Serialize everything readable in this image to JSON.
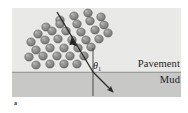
{
  "figure": {
    "type": "physics-refraction-diagram",
    "caption_mark": "a",
    "regions": [
      {
        "id": "pavement",
        "label": "Pavement",
        "color": "#e9e9e7"
      },
      {
        "id": "mud",
        "label": "Mud",
        "color": "#c9c9c7"
      }
    ],
    "labels": {
      "pavement": "Pavement",
      "mud": "Mud",
      "angle_symbol": "θ",
      "angle_subscript": "1"
    },
    "colors": {
      "pavement_fill": "#e9e9e7",
      "mud_fill": "#c8c8c6",
      "interface_line": "#8f8f8d",
      "ray_line": "#242424",
      "normal_line": "#3a3a3a",
      "dot_fill": "#8c8c8c",
      "dot_stroke": "#5c5c5c",
      "dot_highlight": "#f2f2f0",
      "text": "#1d1d1d",
      "background": "#ffffff"
    },
    "geometry": {
      "box_left": 12,
      "box_top": 8,
      "box_right": 181,
      "box_bottom": 97,
      "interface_y": 72,
      "normal_x": 93,
      "incidence_point_x": 93,
      "incidence_point_y": 72
    },
    "incident_ray": {
      "from_x": 57,
      "from_y": 12,
      "to_x": 93,
      "to_y": 72,
      "has_arrowhead": true,
      "arrow_mid_x": 75,
      "arrow_mid_y": 42
    },
    "refracted_ray": {
      "from_x": 93,
      "from_y": 72,
      "to_x": 117,
      "to_y": 96,
      "has_arrowhead": true
    },
    "normal": {
      "from_x": 93,
      "from_y": 48,
      "to_x": 93,
      "to_y": 96
    },
    "dots": [
      {
        "x": 60,
        "y": 20,
        "r": 4.3
      },
      {
        "x": 74,
        "y": 16,
        "r": 4.3
      },
      {
        "x": 88,
        "y": 13,
        "r": 4.3
      },
      {
        "x": 101,
        "y": 17,
        "r": 4.3
      },
      {
        "x": 46,
        "y": 27,
        "r": 4.3
      },
      {
        "x": 60,
        "y": 24,
        "r": 4.3
      },
      {
        "x": 77,
        "y": 24,
        "r": 4.3
      },
      {
        "x": 90,
        "y": 21,
        "r": 4.3
      },
      {
        "x": 104,
        "y": 25,
        "r": 4.3
      },
      {
        "x": 38,
        "y": 34,
        "r": 4.3
      },
      {
        "x": 52,
        "y": 31,
        "r": 4.3
      },
      {
        "x": 66,
        "y": 31,
        "r": 4.3
      },
      {
        "x": 81,
        "y": 32,
        "r": 4.3
      },
      {
        "x": 95,
        "y": 30,
        "r": 4.3
      },
      {
        "x": 108,
        "y": 33,
        "r": 4.3
      },
      {
        "x": 31,
        "y": 42,
        "r": 4.3
      },
      {
        "x": 45,
        "y": 40,
        "r": 4.3
      },
      {
        "x": 58,
        "y": 39,
        "r": 4.3
      },
      {
        "x": 72,
        "y": 40,
        "r": 4.3
      },
      {
        "x": 86,
        "y": 40,
        "r": 4.3
      },
      {
        "x": 99,
        "y": 39,
        "r": 4.3
      },
      {
        "x": 36,
        "y": 50,
        "r": 4.3
      },
      {
        "x": 50,
        "y": 48,
        "r": 4.3
      },
      {
        "x": 64,
        "y": 48,
        "r": 4.3
      },
      {
        "x": 78,
        "y": 48,
        "r": 4.3
      },
      {
        "x": 91,
        "y": 47,
        "r": 4.3
      },
      {
        "x": 29,
        "y": 57,
        "r": 4.3
      },
      {
        "x": 43,
        "y": 56,
        "r": 4.3
      },
      {
        "x": 57,
        "y": 56,
        "r": 4.3
      },
      {
        "x": 70,
        "y": 56,
        "r": 4.3
      },
      {
        "x": 84,
        "y": 56,
        "r": 4.3
      },
      {
        "x": 36,
        "y": 65,
        "r": 4.3
      },
      {
        "x": 50,
        "y": 64,
        "r": 4.3
      },
      {
        "x": 64,
        "y": 64,
        "r": 4.3
      },
      {
        "x": 77,
        "y": 64,
        "r": 4.3
      }
    ]
  }
}
